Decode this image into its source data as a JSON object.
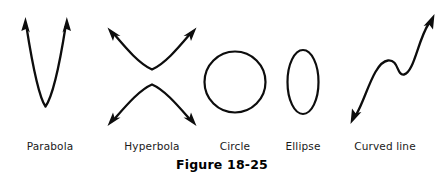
{
  "figure": {
    "caption": "Figure 18-25",
    "background_color": "#ffffff",
    "ink_color": "#0d0d0d",
    "width": 444,
    "height": 181
  },
  "shapes": [
    {
      "name": "parabola",
      "label": "Parabola",
      "label_x": 50,
      "label_y": 140,
      "description": "upward-opening narrow parabola with arrowheads on both upper ends",
      "arrow_count": 2
    },
    {
      "name": "hyperbola",
      "label": "Hyperbola",
      "label_x": 152,
      "label_y": 140,
      "description": "two opposing branches, upper opens up and lower opens down, arrowheads on all four ends",
      "arrow_count": 4
    },
    {
      "name": "circle",
      "label": "Circle",
      "label_x": 235,
      "label_y": 140,
      "description": "closed round curve",
      "arrow_count": 0
    },
    {
      "name": "ellipse",
      "label": "Ellipse",
      "label_x": 303,
      "label_y": 140,
      "description": "tall narrow closed oval",
      "arrow_count": 0
    },
    {
      "name": "curved-line",
      "label": "Curved line",
      "label_x": 385,
      "label_y": 140,
      "description": "S-shaped cubic curve rising left to right with arrowheads on both ends",
      "arrow_count": 2
    }
  ]
}
